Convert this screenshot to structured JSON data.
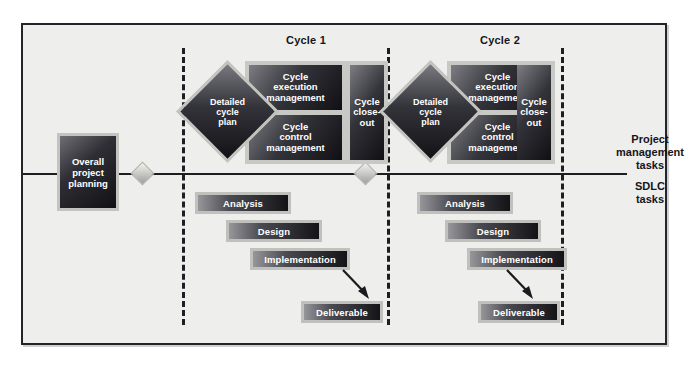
{
  "diagram": {
    "background_color": "#eeeeec",
    "frame_border_color": "#23232a",
    "accent_dark": "#15151a",
    "chip_light_edge": "#c0c0bc"
  },
  "lanes": [
    {
      "id": "pm",
      "caption_line1": "Project",
      "caption_line2": "management",
      "caption_line3": "tasks"
    },
    {
      "id": "sdlc",
      "caption_line1": "SDLC",
      "caption_line2": "tasks"
    }
  ],
  "phase_labels": [
    {
      "id": "cycle-1",
      "label": "Cycle 1"
    },
    {
      "id": "cycle-2",
      "label": "Cycle 2"
    }
  ],
  "pre_cycle": {
    "planning_label_line1": "Overall",
    "planning_label_line2": "project",
    "planning_label_line3": "planning"
  },
  "cycles": [
    {
      "id": "cycle-1",
      "detailed_plan_line1": "Detailed",
      "detailed_plan_line2": "cycle",
      "detailed_plan_line3": "plan",
      "execution_line1": "Cycle",
      "execution_line2": "execution",
      "execution_line3": "management",
      "control_line1": "Cycle",
      "control_line2": "control",
      "control_line3": "management",
      "closeout_line1": "Cycle",
      "closeout_line2": "close-",
      "closeout_line3": "out",
      "sdlc_bars": [
        {
          "id": "analysis",
          "label": "Analysis"
        },
        {
          "id": "design",
          "label": "Design"
        },
        {
          "id": "implementation",
          "label": "Implementation"
        },
        {
          "id": "deliverable",
          "label": "Deliverable"
        }
      ]
    },
    {
      "id": "cycle-2",
      "detailed_plan_line1": "Detailed",
      "detailed_plan_line2": "cycle",
      "detailed_plan_line3": "plan",
      "execution_line1": "Cycle",
      "execution_line2": "execution",
      "execution_line3": "management",
      "control_line1": "Cycle",
      "control_line2": "control",
      "control_line3": "management",
      "closeout_line1": "Cycle",
      "closeout_line2": "close-",
      "closeout_line3": "out",
      "sdlc_bars": [
        {
          "id": "analysis",
          "label": "Analysis"
        },
        {
          "id": "design",
          "label": "Design"
        },
        {
          "id": "implementation",
          "label": "Implementation"
        },
        {
          "id": "deliverable",
          "label": "Deliverable"
        }
      ]
    }
  ],
  "milestones": [
    {
      "id": "milestone-1",
      "name": "milestone-diamond"
    },
    {
      "id": "milestone-2",
      "name": "milestone-diamond"
    }
  ],
  "connectors": [
    {
      "id": "planning-to-cycle1",
      "name": "timeline-connector"
    }
  ]
}
